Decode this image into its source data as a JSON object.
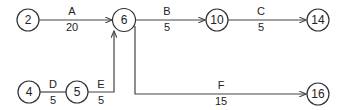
{
  "diagram": {
    "type": "activity-on-arrow network",
    "nodes": [
      {
        "id": "2",
        "label": "2",
        "cx": 28,
        "cy": 20
      },
      {
        "id": "6",
        "label": "6",
        "cx": 124,
        "cy": 20
      },
      {
        "id": "10",
        "label": "10",
        "cx": 217,
        "cy": 20
      },
      {
        "id": "14",
        "label": "14",
        "cx": 318,
        "cy": 20
      },
      {
        "id": "4",
        "label": "4",
        "cx": 29,
        "cy": 92
      },
      {
        "id": "5",
        "label": "5",
        "cx": 77,
        "cy": 92
      },
      {
        "id": "16",
        "label": "16",
        "cx": 318,
        "cy": 94
      }
    ],
    "edges": [
      {
        "activity": "A",
        "duration": "20",
        "from": "2",
        "to": "6"
      },
      {
        "activity": "B",
        "duration": "5",
        "from": "6",
        "to": "10"
      },
      {
        "activity": "C",
        "duration": "5",
        "from": "10",
        "to": "14"
      },
      {
        "activity": "D",
        "duration": "5",
        "from": "4",
        "to": "5"
      },
      {
        "activity": "E",
        "duration": "5",
        "from": "5",
        "to": "6"
      },
      {
        "activity": "F",
        "duration": "15",
        "from": "6",
        "to": "16"
      }
    ]
  }
}
